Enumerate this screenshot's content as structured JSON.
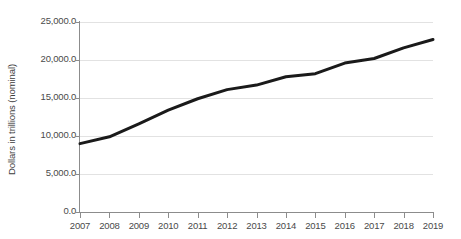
{
  "chart_data": {
    "type": "line",
    "title": "",
    "subtitle": "",
    "xlabel": "",
    "ylabel": "Dollars in trillions (nominal)",
    "categories": [
      "2007",
      "2008",
      "2009",
      "2010",
      "2011",
      "2012",
      "2013",
      "2014",
      "2015",
      "2016",
      "2017",
      "2018",
      "2019"
    ],
    "x": [
      2007,
      2008,
      2009,
      2010,
      2011,
      2012,
      2013,
      2014,
      2015,
      2016,
      2017,
      2018,
      2019
    ],
    "values": [
      9000.0,
      9900.0,
      11600.0,
      13400.0,
      14900.0,
      16100.0,
      16700.0,
      17800.0,
      18200.0,
      19600.0,
      20200.0,
      21600.0,
      22700.0
    ],
    "series": [
      {
        "name": "Dollars in trillions (nominal)",
        "values": [
          9000.0,
          9900.0,
          11600.0,
          13400.0,
          14900.0,
          16100.0,
          16700.0,
          17800.0,
          18200.0,
          19600.0,
          20200.0,
          21600.0,
          22700.0
        ],
        "color": "#1a1a1a",
        "line_width": 3
      }
    ],
    "ylim": [
      0,
      25000
    ],
    "xlim": [
      2007,
      2019
    ],
    "y_ticks": [
      0,
      5000,
      10000,
      15000,
      20000,
      25000
    ],
    "y_tick_labels": [
      "0.0",
      "5,000.0",
      "10,000.0",
      "15,000.0",
      "20,000.0",
      "25,000.0"
    ],
    "x_tick_labels": [
      "2007",
      "2008",
      "2009",
      "2010",
      "2011",
      "2012",
      "2013",
      "2014",
      "2015",
      "2016",
      "2017",
      "2018",
      "2019"
    ],
    "grid": true,
    "grid_axis": "y",
    "grid_color": "#e2e2e2",
    "legend": false,
    "legend_position": "none",
    "background_color": "#ffffff",
    "axis_color": "#8c8c8c",
    "tick_label_color": "#4a4a4a",
    "annotations": []
  }
}
